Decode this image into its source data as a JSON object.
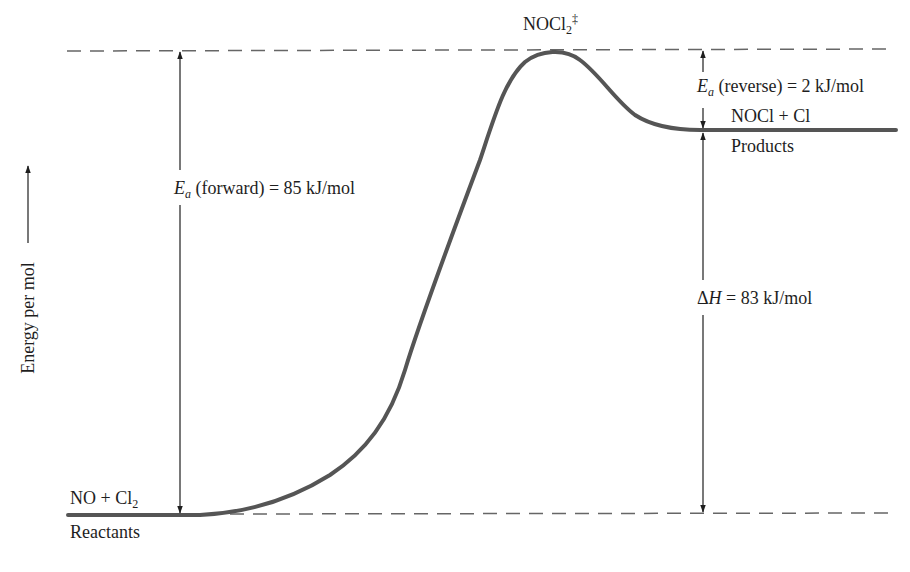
{
  "diagram": {
    "type": "reaction-energy-profile",
    "y_axis_label": "Energy per mol",
    "transition_state": {
      "formula": "NOCl",
      "subscript": "2",
      "superscript": "‡"
    },
    "reactants": {
      "formula_main": "NO + Cl",
      "subscript": "2",
      "caption": "Reactants"
    },
    "products": {
      "formula": "NOCl + Cl",
      "caption": "Products"
    },
    "ea_forward": {
      "symbol": "E",
      "subscript": "a",
      "text": " (forward) = 85 kJ/mol",
      "value_kj_per_mol": 85
    },
    "ea_reverse": {
      "symbol": "E",
      "subscript": "a",
      "text": " (reverse) = 2 kJ/mol",
      "value_kj_per_mol": 2
    },
    "delta_h": {
      "symbol": "ΔH",
      "prefix": "Δ",
      "italic": "H",
      "text": " = 83 kJ/mol",
      "value_kj_per_mol": 83
    },
    "colors": {
      "curve": "#555555",
      "text": "#1e1e1e",
      "dashes": "#666666"
    }
  }
}
